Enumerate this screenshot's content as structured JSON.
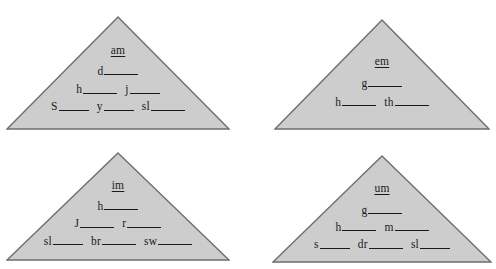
{
  "page": {
    "background_color": "#ffffff",
    "shape_fill_color": "#cdcdcd",
    "shape_stroke_color": "#6e6e6e",
    "text_color": "#1a1a1a"
  },
  "pyramids": [
    {
      "id": "am",
      "label": "am",
      "rows": [
        {
          "cells": [
            {
              "prefix": "am",
              "blank": "none"
            }
          ]
        },
        {
          "cells": [
            {
              "prefix": "d",
              "blank": "long"
            }
          ]
        },
        {
          "cells": [
            {
              "prefix": "h",
              "blank": "long"
            },
            {
              "prefix": "j",
              "blank": "mid"
            }
          ]
        },
        {
          "cells": [
            {
              "prefix": "S",
              "blank": "mid"
            },
            {
              "prefix": "y",
              "blank": "mid"
            },
            {
              "prefix": "sl",
              "blank": "long"
            }
          ]
        }
      ]
    },
    {
      "id": "em",
      "label": "em",
      "rows": [
        {
          "cells": [
            {
              "prefix": "em",
              "blank": "none"
            }
          ]
        },
        {
          "cells": [
            {
              "prefix": "g",
              "blank": "long"
            }
          ]
        },
        {
          "cells": [
            {
              "prefix": "h",
              "blank": "long"
            },
            {
              "prefix": "th",
              "blank": "long"
            }
          ]
        }
      ]
    },
    {
      "id": "im",
      "label": "im",
      "rows": [
        {
          "cells": [
            {
              "prefix": "im",
              "blank": "none"
            }
          ]
        },
        {
          "cells": [
            {
              "prefix": "h",
              "blank": "long"
            }
          ]
        },
        {
          "cells": [
            {
              "prefix": "J",
              "blank": "long"
            },
            {
              "prefix": "r",
              "blank": "long"
            }
          ]
        },
        {
          "cells": [
            {
              "prefix": "sl",
              "blank": "mid"
            },
            {
              "prefix": "br",
              "blank": "long"
            },
            {
              "prefix": "sw",
              "blank": "long"
            }
          ]
        }
      ]
    },
    {
      "id": "um",
      "label": "um",
      "rows": [
        {
          "cells": [
            {
              "prefix": "um",
              "blank": "none"
            }
          ]
        },
        {
          "cells": [
            {
              "prefix": "g",
              "blank": "long"
            }
          ]
        },
        {
          "cells": [
            {
              "prefix": "h",
              "blank": "long"
            },
            {
              "prefix": "m",
              "blank": "long"
            }
          ]
        },
        {
          "cells": [
            {
              "prefix": "s",
              "blank": "mid"
            },
            {
              "prefix": "dr",
              "blank": "long"
            },
            {
              "prefix": "sl",
              "blank": "mid"
            }
          ]
        }
      ]
    }
  ]
}
